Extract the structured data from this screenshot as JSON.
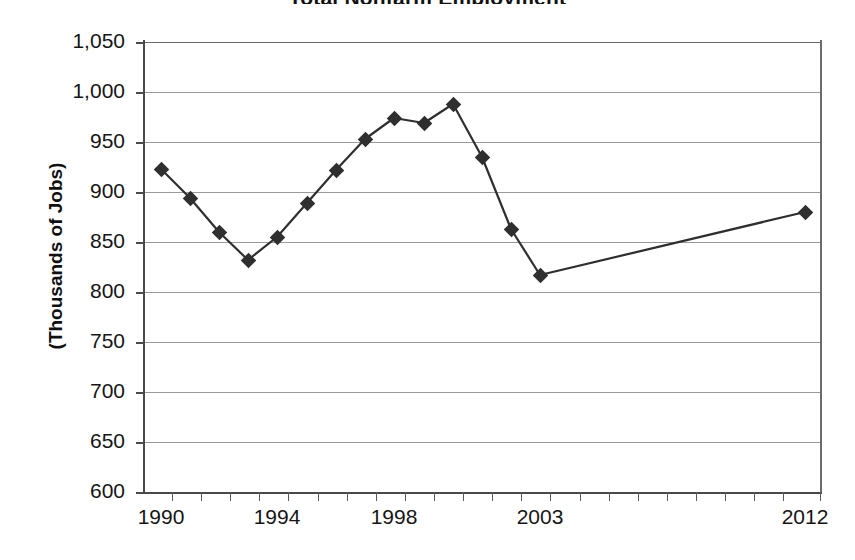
{
  "chart": {
    "title_clipped": "Total Nonfarm Employment",
    "ylabel": "(Thousands of Jobs)"
  },
  "chart_data": {
    "type": "line",
    "title": "Total Nonfarm Employment",
    "xlabel": "",
    "ylabel": "(Thousands of Jobs)",
    "ylim": [
      600,
      1050
    ],
    "ytick_labels": [
      "1,050",
      "1,000",
      "950",
      "900",
      "850",
      "800",
      "750",
      "700",
      "650",
      "600"
    ],
    "ytick_values": [
      1050,
      1000,
      950,
      900,
      850,
      800,
      750,
      700,
      650,
      600
    ],
    "xtick_labels": [
      "1990",
      "1994",
      "1998",
      "2003",
      "2012"
    ],
    "grid": "horizontal",
    "legend": "none",
    "marker": "diamond",
    "line_color": "#2f2f2f",
    "marker_color": "#2f2f2f",
    "categories": [
      1990,
      1991,
      1992,
      1993,
      1994,
      1995,
      1996,
      1997,
      1998,
      1999,
      2000,
      2001,
      2002,
      2003,
      2012
    ],
    "values": [
      923,
      894,
      860,
      832,
      855,
      889,
      922,
      953,
      974,
      969,
      988,
      935,
      863,
      817,
      880
    ],
    "series": [
      {
        "name": "Total Nonfarm Employment",
        "points": [
          {
            "x": 1990,
            "y": 923
          },
          {
            "x": 1991,
            "y": 894
          },
          {
            "x": 1992,
            "y": 860
          },
          {
            "x": 1993,
            "y": 832
          },
          {
            "x": 1994,
            "y": 855
          },
          {
            "x": 1995,
            "y": 889
          },
          {
            "x": 1996,
            "y": 922
          },
          {
            "x": 1997,
            "y": 953
          },
          {
            "x": 1998,
            "y": 974
          },
          {
            "x": 1999,
            "y": 969
          },
          {
            "x": 2000,
            "y": 988
          },
          {
            "x": 2001,
            "y": 935
          },
          {
            "x": 2002,
            "y": 863
          },
          {
            "x": 2003,
            "y": 817
          },
          {
            "x": 2012,
            "y": 880
          }
        ]
      }
    ]
  },
  "axis_geometry": {
    "plot_left": 143,
    "plot_top": 42,
    "plot_width": 677,
    "plot_height": 450,
    "x_positions": [
      161,
      190,
      219,
      248,
      277,
      307,
      336,
      365,
      394,
      424,
      453,
      482,
      511,
      540,
      805
    ],
    "x_tick_positions": [
      172,
      201,
      230,
      259,
      288,
      318,
      347,
      376,
      405,
      434,
      463,
      492,
      521,
      550,
      580,
      609,
      638,
      667,
      696,
      725,
      754,
      783,
      820
    ],
    "x_label_positions": [
      161,
      277,
      394,
      540,
      805
    ]
  }
}
